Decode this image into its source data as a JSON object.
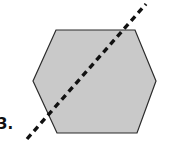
{
  "figure": {
    "label": "3.",
    "background_color": "#ffffff",
    "shape": {
      "name": "hexagon",
      "fill_color": "#c9c9c9",
      "stroke_color": "#2b2b2b",
      "stroke_width": 1.2,
      "vertices": [
        [
          56,
          30
        ],
        [
          135,
          30
        ],
        [
          156,
          81
        ],
        [
          137,
          133
        ],
        [
          57,
          133
        ],
        [
          33,
          81
        ]
      ]
    },
    "line": {
      "name": "dashed-diagonal-line",
      "style": "dashed",
      "color": "#111111",
      "stroke_width": 3.4,
      "dash_length": 6,
      "gap_length": 4.5,
      "start": [
        27,
        139
      ],
      "end": [
        146,
        4
      ]
    }
  },
  "chart_data": {
    "type": "diagram",
    "annotations": [
      "3."
    ]
  }
}
